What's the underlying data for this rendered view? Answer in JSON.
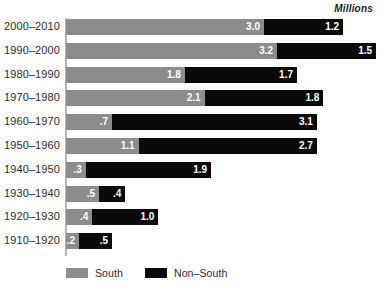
{
  "units_label": "Millions",
  "legend": {
    "items": [
      {
        "label": "South",
        "color": "#8c8c8c",
        "swatch_name": "legend-swatch-south"
      },
      {
        "label": "Non–South",
        "color": "#0a0a0a",
        "swatch_name": "legend-swatch-non-south"
      }
    ]
  },
  "colors": {
    "south": "#8c8c8c",
    "non_south": "#0a0a0a",
    "axis": "#b5b5b5",
    "label_text": "#2b2b2b",
    "value_text": "#ffffff",
    "background": "#ffffff"
  },
  "chart_data": {
    "type": "bar",
    "orientation": "horizontal",
    "stacked": true,
    "title": "",
    "subtitle": "",
    "xlabel": "",
    "ylabel": "",
    "units": "Millions",
    "xlim": [
      0,
      4.7
    ],
    "grid": false,
    "legend_position": "bottom-left",
    "categories": [
      "2000–2010",
      "1990–2000",
      "1980–1990",
      "1970–1980",
      "1960–1970",
      "1950–1960",
      "1940–1950",
      "1930–1940",
      "1920–1930",
      "1910–1920"
    ],
    "series": [
      {
        "name": "South",
        "color": "#8c8c8c",
        "values": [
          3.0,
          3.2,
          1.8,
          2.1,
          0.7,
          1.1,
          0.3,
          0.5,
          0.4,
          0.2
        ],
        "labels": [
          "3.0",
          "3.2",
          "1.8",
          "2.1",
          ".7",
          "1.1",
          ".3",
          ".5",
          ".4",
          ".2"
        ]
      },
      {
        "name": "Non–South",
        "color": "#0a0a0a",
        "values": [
          1.2,
          1.5,
          1.7,
          1.8,
          3.1,
          2.7,
          1.9,
          0.4,
          1.0,
          0.5
        ],
        "labels": [
          "1.2",
          "1.5",
          "1.7",
          "1.8",
          "3.1",
          "2.7",
          "1.9",
          ".4",
          "1.0",
          ".5"
        ]
      }
    ],
    "totals": [
      4.2,
      4.7,
      3.5,
      3.9,
      3.8,
      3.8,
      2.2,
      0.9,
      1.4,
      0.7
    ]
  }
}
